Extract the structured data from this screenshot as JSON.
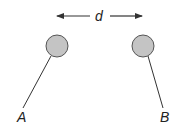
{
  "diagram": {
    "type": "physics-two-suspended-spheres",
    "distance_label": "d",
    "spheres": [
      {
        "label": "A",
        "cx": 57,
        "cy": 46,
        "r": 11,
        "string_top": [
          51,
          56
        ],
        "string_bottom": [
          23,
          108
        ],
        "label_pos": [
          17,
          122
        ]
      },
      {
        "label": "B",
        "cx": 143,
        "cy": 46,
        "r": 11,
        "string_top": [
          148,
          56
        ],
        "string_bottom": [
          163,
          108
        ],
        "label_pos": [
          160,
          122
        ]
      }
    ],
    "arrow": {
      "y": 16,
      "left_start": 90,
      "left_end": 57,
      "right_start": 110,
      "right_end": 142,
      "label_x": 99,
      "label_y": 21
    },
    "colors": {
      "sphere_fill": "#c4c4c4",
      "sphere_stroke": "#555555",
      "line": "#333333",
      "text": "#222222",
      "background": "#ffffff"
    }
  }
}
